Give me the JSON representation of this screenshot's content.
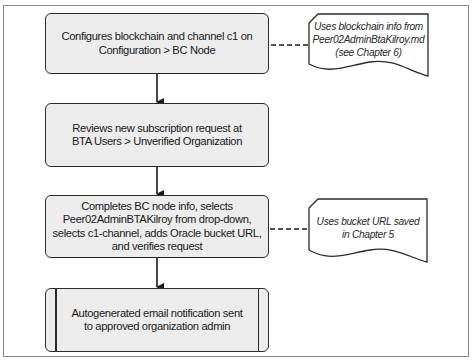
{
  "diagram": {
    "type": "flowchart",
    "colors": {
      "box_fill": "#ececec",
      "stroke": "#2a2a2a",
      "frame": "#8a8a8a",
      "background": "#ffffff"
    },
    "steps": [
      {
        "id": "step1",
        "shape": "rounded-rectangle",
        "lines": [
          "Configures blockchain and channel c1 on",
          "Configuration > BC Node"
        ]
      },
      {
        "id": "step2",
        "shape": "rounded-rectangle",
        "lines": [
          "Reviews new subscription request at",
          "BTA Users > Unverified Organization"
        ]
      },
      {
        "id": "step3",
        "shape": "rounded-rectangle",
        "lines": [
          "Completes BC node info, selects",
          "Peer02AdminBTAKilroy from drop-down,",
          "selects c1-channel, adds Oracle bucket URL,",
          "and verifies request"
        ]
      },
      {
        "id": "step4",
        "shape": "predefined-process",
        "lines": [
          "Autogenerated email notification sent",
          "to approved organization admin"
        ]
      }
    ],
    "notes": [
      {
        "id": "note1",
        "shape": "document",
        "attached_to": "step1",
        "lines": [
          "Uses blockchain info from",
          "Peer02AdminBtaKilroy.md",
          "(see Chapter 6)"
        ]
      },
      {
        "id": "note2",
        "shape": "document",
        "attached_to": "step3",
        "lines": [
          "Uses bucket URL saved",
          "in Chapter 5"
        ]
      }
    ],
    "edges": [
      {
        "from": "step1",
        "to": "step2",
        "style": "solid-arrow"
      },
      {
        "from": "step2",
        "to": "step3",
        "style": "solid-arrow"
      },
      {
        "from": "step3",
        "to": "step4",
        "style": "solid-arrow"
      },
      {
        "from": "step1",
        "to": "note1",
        "style": "dashed"
      },
      {
        "from": "step3",
        "to": "note2",
        "style": "dashed"
      }
    ]
  }
}
